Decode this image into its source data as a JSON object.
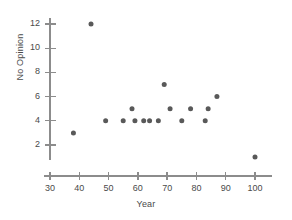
{
  "chart_data": {
    "type": "scatter",
    "title": "",
    "xlabel": "Year",
    "ylabel": "No Opinion",
    "xlim": [
      30,
      104
    ],
    "ylim": [
      0,
      13
    ],
    "xticks": [
      30,
      40,
      50,
      60,
      70,
      80,
      90,
      100
    ],
    "yticks": [
      2,
      4,
      6,
      8,
      10,
      12
    ],
    "grid": false,
    "legend": false,
    "marker": "filled-circle",
    "marker_color": "#595959",
    "axis_color": "#8c8c8c",
    "points": [
      {
        "x": 38,
        "y": 3
      },
      {
        "x": 44,
        "y": 12
      },
      {
        "x": 49,
        "y": 4
      },
      {
        "x": 55,
        "y": 4
      },
      {
        "x": 58,
        "y": 5
      },
      {
        "x": 59,
        "y": 4
      },
      {
        "x": 62,
        "y": 4
      },
      {
        "x": 64,
        "y": 4
      },
      {
        "x": 67,
        "y": 4
      },
      {
        "x": 69,
        "y": 7
      },
      {
        "x": 71,
        "y": 5
      },
      {
        "x": 75,
        "y": 4
      },
      {
        "x": 78,
        "y": 5
      },
      {
        "x": 83,
        "y": 4
      },
      {
        "x": 84,
        "y": 5
      },
      {
        "x": 87,
        "y": 6
      },
      {
        "x": 100,
        "y": 1
      }
    ]
  }
}
